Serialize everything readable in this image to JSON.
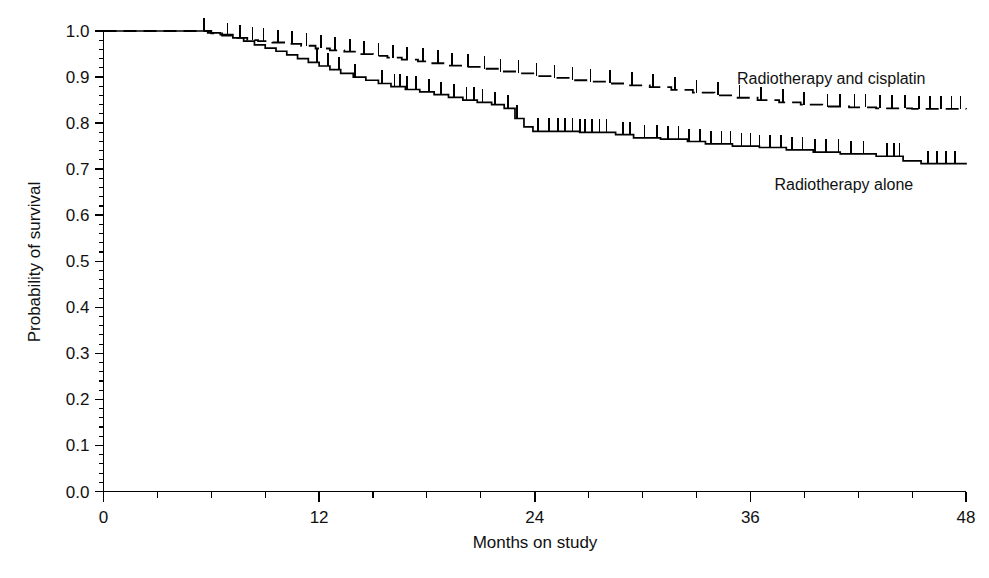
{
  "chart_data": {
    "type": "line",
    "subtype": "kaplan-meier-survival",
    "title": "",
    "xlabel": "Months on study",
    "ylabel": "Probability of survival",
    "xlim": [
      0,
      48
    ],
    "ylim": [
      0.0,
      1.0
    ],
    "grid": false,
    "legend_position": "inline-annotation",
    "x_ticks": [
      0,
      12,
      24,
      36,
      48
    ],
    "x_tick_labels": [
      "0",
      "12",
      "24",
      "36",
      "48"
    ],
    "x_minor_tick_interval": 3,
    "y_ticks": [
      0.0,
      0.1,
      0.2,
      0.3,
      0.4,
      0.5,
      0.6,
      0.7,
      0.8,
      0.9,
      1.0
    ],
    "y_tick_labels": [
      "0.0",
      "0.1",
      "0.2",
      "0.3",
      "0.4",
      "0.5",
      "0.6",
      "0.7",
      "0.8",
      "0.9",
      "1.0"
    ],
    "y_minor_tick_interval": 0.02,
    "series": [
      {
        "name": "Radiotherapy and cisplatin",
        "line_style": "dashed",
        "color": "#000000",
        "label_text": "Radiotherapy and cisplatin",
        "label_x": 40.5,
        "label_y": 0.885,
        "final_value": 0.83,
        "steps": [
          [
            0.0,
            1.0
          ],
          [
            5.2,
            1.0
          ],
          [
            6.0,
            0.995
          ],
          [
            6.6,
            0.99
          ],
          [
            7.3,
            0.985
          ],
          [
            8.0,
            0.98
          ],
          [
            8.6,
            0.978
          ],
          [
            9.4,
            0.975
          ],
          [
            10.2,
            0.972
          ],
          [
            11.0,
            0.968
          ],
          [
            11.8,
            0.962
          ],
          [
            12.6,
            0.958
          ],
          [
            13.4,
            0.955
          ],
          [
            14.2,
            0.95
          ],
          [
            15.0,
            0.946
          ],
          [
            15.8,
            0.942
          ],
          [
            16.6,
            0.938
          ],
          [
            17.5,
            0.934
          ],
          [
            18.3,
            0.93
          ],
          [
            19.2,
            0.925
          ],
          [
            20.0,
            0.922
          ],
          [
            21.0,
            0.918
          ],
          [
            22.0,
            0.912
          ],
          [
            23.0,
            0.908
          ],
          [
            24.0,
            0.902
          ],
          [
            25.0,
            0.898
          ],
          [
            26.0,
            0.893
          ],
          [
            27.0,
            0.89
          ],
          [
            28.0,
            0.886
          ],
          [
            29.2,
            0.882
          ],
          [
            30.4,
            0.878
          ],
          [
            31.6,
            0.872
          ],
          [
            32.8,
            0.866
          ],
          [
            34.0,
            0.86
          ],
          [
            35.2,
            0.855
          ],
          [
            36.4,
            0.85
          ],
          [
            37.6,
            0.845
          ],
          [
            38.8,
            0.84
          ],
          [
            40.0,
            0.836
          ],
          [
            41.5,
            0.834
          ],
          [
            43.0,
            0.832
          ],
          [
            45.0,
            0.831
          ],
          [
            48.0,
            0.83
          ]
        ],
        "censor_times": [
          5.6,
          6.9,
          7.6,
          8.3,
          8.9,
          9.7,
          10.5,
          11.3,
          12.1,
          12.9,
          13.7,
          14.5,
          15.3,
          16.1,
          16.9,
          17.8,
          18.6,
          19.4,
          20.3,
          21.2,
          22.1,
          23.1,
          24.1,
          25.1,
          26.1,
          27.1,
          28.2,
          29.4,
          30.6,
          31.8,
          33.0,
          34.2,
          35.4,
          36.6,
          37.8,
          39.0,
          40.3,
          41.0,
          41.8,
          42.4,
          43.2,
          43.9,
          44.6,
          45.4,
          46.0,
          46.6,
          47.2,
          47.7
        ]
      },
      {
        "name": "Radiotherapy alone",
        "line_style": "solid",
        "color": "#000000",
        "label_text": "Radiotherapy alone",
        "label_x": 41.2,
        "label_y": 0.655,
        "final_value": 0.71,
        "steps": [
          [
            0.0,
            1.0
          ],
          [
            5.0,
            1.0
          ],
          [
            5.8,
            0.996
          ],
          [
            6.5,
            0.992
          ],
          [
            7.2,
            0.985
          ],
          [
            7.8,
            0.978
          ],
          [
            8.4,
            0.97
          ],
          [
            9.0,
            0.963
          ],
          [
            9.6,
            0.956
          ],
          [
            10.2,
            0.948
          ],
          [
            10.8,
            0.94
          ],
          [
            11.4,
            0.932
          ],
          [
            12.0,
            0.924
          ],
          [
            12.6,
            0.916
          ],
          [
            13.2,
            0.908
          ],
          [
            13.9,
            0.9
          ],
          [
            14.6,
            0.893
          ],
          [
            15.3,
            0.886
          ],
          [
            16.0,
            0.879
          ],
          [
            16.8,
            0.873
          ],
          [
            17.6,
            0.868
          ],
          [
            18.4,
            0.862
          ],
          [
            19.2,
            0.856
          ],
          [
            20.0,
            0.85
          ],
          [
            20.8,
            0.845
          ],
          [
            21.6,
            0.84
          ],
          [
            22.3,
            0.832
          ],
          [
            22.9,
            0.81
          ],
          [
            23.4,
            0.792
          ],
          [
            23.9,
            0.782
          ],
          [
            26.5,
            0.78
          ],
          [
            28.5,
            0.775
          ],
          [
            29.5,
            0.768
          ],
          [
            31.0,
            0.765
          ],
          [
            32.5,
            0.76
          ],
          [
            33.5,
            0.755
          ],
          [
            35.0,
            0.75
          ],
          [
            36.5,
            0.747
          ],
          [
            38.0,
            0.742
          ],
          [
            39.5,
            0.737
          ],
          [
            41.0,
            0.733
          ],
          [
            43.0,
            0.728
          ],
          [
            44.5,
            0.718
          ],
          [
            45.5,
            0.712
          ],
          [
            48.0,
            0.71
          ]
        ],
        "censor_times": [
          11.9,
          12.5,
          13.1,
          14.0,
          15.5,
          16.2,
          16.5,
          16.9,
          17.4,
          18.1,
          18.8,
          19.5,
          20.2,
          20.6,
          21.1,
          21.8,
          22.5,
          23.0,
          24.2,
          24.8,
          25.3,
          25.7,
          26.1,
          26.5,
          26.8,
          27.2,
          27.6,
          28.0,
          28.9,
          29.3,
          30.1,
          30.8,
          31.4,
          32.0,
          32.6,
          33.2,
          33.8,
          34.4,
          34.9,
          35.5,
          36.0,
          36.5,
          37.1,
          37.7,
          38.3,
          38.9,
          39.6,
          40.2,
          40.9,
          41.6,
          42.3,
          43.6,
          44.0,
          44.3,
          45.9,
          46.4,
          46.9,
          47.4
        ]
      }
    ]
  },
  "axes": {
    "y_title": "Probability of survival",
    "x_title": "Months on study"
  }
}
